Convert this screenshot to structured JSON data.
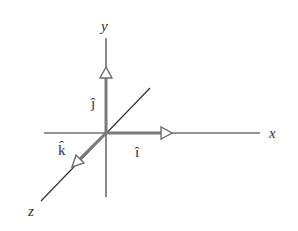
{
  "diagram": {
    "axes": {
      "x": {
        "label": "x"
      },
      "y": {
        "label": "y"
      },
      "z": {
        "label": "z"
      }
    },
    "unit_vectors": {
      "i": {
        "label": "î",
        "direction": "x"
      },
      "j": {
        "label": "ĵ",
        "direction": "y"
      },
      "k": {
        "label": "k̂",
        "direction": "z"
      }
    },
    "colors": {
      "axis": "#2a2a2a",
      "vector": "#7a7a7a",
      "label": "#333333"
    }
  }
}
